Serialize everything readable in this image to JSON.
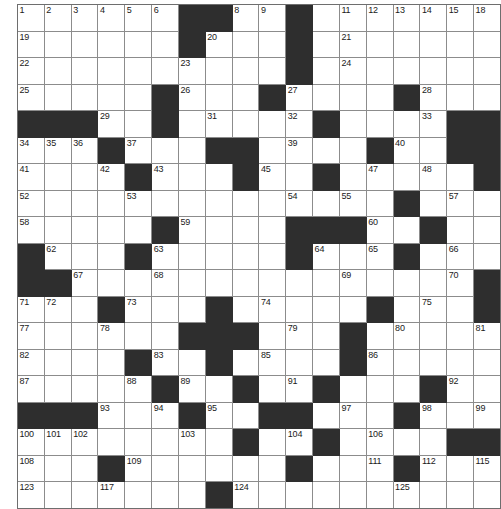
{
  "puzzle": {
    "type": "crossword-grid",
    "columns": 18,
    "rows": 19,
    "cell_size_px": 26,
    "colors": {
      "block": "#2e2e2e",
      "open": "#ffffff",
      "gridline": "#8c8c8c",
      "number_text": "#1a1a1a"
    },
    "total_clue_numbers": 125,
    "column_headers": [
      "1",
      "2",
      "3",
      "4",
      "5",
      "6",
      "7",
      "8",
      "9",
      "10",
      "11",
      "12",
      "13",
      "14",
      "15",
      "16",
      "17",
      "18"
    ],
    "blocks": [
      [
        0,
        6
      ],
      [
        0,
        7
      ],
      [
        0,
        10
      ],
      [
        1,
        6
      ],
      [
        1,
        10
      ],
      [
        2,
        10
      ],
      [
        3,
        5
      ],
      [
        3,
        9
      ],
      [
        3,
        14
      ],
      [
        4,
        0
      ],
      [
        4,
        1
      ],
      [
        4,
        2
      ],
      [
        4,
        5
      ],
      [
        4,
        11
      ],
      [
        4,
        16
      ],
      [
        4,
        17
      ],
      [
        5,
        3
      ],
      [
        5,
        7
      ],
      [
        5,
        8
      ],
      [
        5,
        13
      ],
      [
        5,
        16
      ],
      [
        5,
        17
      ],
      [
        6,
        4
      ],
      [
        6,
        8
      ],
      [
        6,
        11
      ],
      [
        6,
        17
      ],
      [
        7,
        14
      ],
      [
        8,
        5
      ],
      [
        8,
        10
      ],
      [
        8,
        11
      ],
      [
        8,
        12
      ],
      [
        8,
        15
      ],
      [
        9,
        0
      ],
      [
        9,
        4
      ],
      [
        9,
        10
      ],
      [
        9,
        14
      ],
      [
        10,
        0
      ],
      [
        10,
        1
      ],
      [
        10,
        17
      ],
      [
        11,
        3
      ],
      [
        11,
        7
      ],
      [
        11,
        13
      ],
      [
        11,
        17
      ],
      [
        12,
        6
      ],
      [
        12,
        7
      ],
      [
        12,
        8
      ],
      [
        12,
        12
      ],
      [
        13,
        4
      ],
      [
        13,
        7
      ],
      [
        13,
        12
      ],
      [
        14,
        5
      ],
      [
        14,
        8
      ],
      [
        14,
        11
      ],
      [
        14,
        15
      ],
      [
        15,
        0
      ],
      [
        15,
        1
      ],
      [
        15,
        2
      ],
      [
        15,
        6
      ],
      [
        15,
        9
      ],
      [
        15,
        10
      ],
      [
        15,
        14
      ],
      [
        16,
        8
      ],
      [
        16,
        11
      ],
      [
        16,
        16
      ],
      [
        16,
        17
      ],
      [
        17,
        3
      ],
      [
        17,
        10
      ],
      [
        17,
        14
      ],
      [
        18,
        7
      ],
      [
        19,
        7
      ]
    ],
    "numbered_cells": [
      {
        "n": 1,
        "row": 0,
        "col": 0
      },
      {
        "n": 2,
        "row": 0,
        "col": 1
      },
      {
        "n": 3,
        "row": 0,
        "col": 2
      },
      {
        "n": 4,
        "row": 0,
        "col": 3
      },
      {
        "n": 5,
        "row": 0,
        "col": 4
      },
      {
        "n": 6,
        "row": 0,
        "col": 5
      },
      {
        "n": 7,
        "row": 0,
        "col": 7
      },
      {
        "n": 8,
        "row": 0,
        "col": 8
      },
      {
        "n": 9,
        "row": 0,
        "col": 9
      },
      {
        "n": 10,
        "row": 0,
        "col": 10
      },
      {
        "n": 11,
        "row": 0,
        "col": 12
      },
      {
        "n": 12,
        "row": 0,
        "col": 13
      },
      {
        "n": 13,
        "row": 0,
        "col": 14
      },
      {
        "n": 14,
        "row": 0,
        "col": 15
      },
      {
        "n": 15,
        "row": 0,
        "col": 16
      },
      {
        "n": 16,
        "row": 0,
        "col": 17
      },
      {
        "n": 17,
        "row": 0,
        "col": 18
      },
      {
        "n": 18,
        "row": 0,
        "col": 19
      },
      {
        "n": 19,
        "row": 1,
        "col": 0
      },
      {
        "n": 20,
        "row": 1,
        "col": 7
      },
      {
        "n": 21,
        "row": 1,
        "col": 12
      },
      {
        "n": 22,
        "row": 2,
        "col": 0
      },
      {
        "n": 23,
        "row": 2,
        "col": 6
      },
      {
        "n": 24,
        "row": 2,
        "col": 12
      },
      {
        "n": 25,
        "row": 3,
        "col": 0
      },
      {
        "n": 26,
        "row": 3,
        "col": 6
      },
      {
        "n": 27,
        "row": 3,
        "col": 10
      },
      {
        "n": 28,
        "row": 3,
        "col": 15
      },
      {
        "n": 29,
        "row": 4,
        "col": 3
      },
      {
        "n": 30,
        "row": 4,
        "col": 5
      },
      {
        "n": 31,
        "row": 4,
        "col": 7
      },
      {
        "n": 32,
        "row": 4,
        "col": 10
      },
      {
        "n": 33,
        "row": 4,
        "col": 15
      },
      {
        "n": 34,
        "row": 5,
        "col": 0
      },
      {
        "n": 35,
        "row": 5,
        "col": 1
      },
      {
        "n": 36,
        "row": 5,
        "col": 2
      },
      {
        "n": 37,
        "row": 5,
        "col": 4
      },
      {
        "n": 38,
        "row": 5,
        "col": 7
      },
      {
        "n": 39,
        "row": 5,
        "col": 10
      },
      {
        "n": 40,
        "row": 5,
        "col": 14
      },
      {
        "n": 41,
        "row": 6,
        "col": 0
      },
      {
        "n": 42,
        "row": 6,
        "col": 3
      },
      {
        "n": 43,
        "row": 6,
        "col": 5
      },
      {
        "n": 44,
        "row": 6,
        "col": 8
      },
      {
        "n": 45,
        "row": 6,
        "col": 9
      },
      {
        "n": 46,
        "row": 6,
        "col": 11
      },
      {
        "n": 47,
        "row": 6,
        "col": 13
      },
      {
        "n": 48,
        "row": 6,
        "col": 15
      },
      {
        "n": 49,
        "row": 6,
        "col": 17
      },
      {
        "n": 50,
        "row": 6,
        "col": 18
      },
      {
        "n": 51,
        "row": 6,
        "col": 19
      },
      {
        "n": 52,
        "row": 7,
        "col": 0
      },
      {
        "n": 53,
        "row": 7,
        "col": 4
      },
      {
        "n": 54,
        "row": 7,
        "col": 10
      },
      {
        "n": 55,
        "row": 7,
        "col": 12
      },
      {
        "n": 56,
        "row": 7,
        "col": 14
      },
      {
        "n": 57,
        "row": 7,
        "col": 16
      },
      {
        "n": 58,
        "row": 8,
        "col": 0
      },
      {
        "n": 59,
        "row": 8,
        "col": 6
      },
      {
        "n": 60,
        "row": 8,
        "col": 13
      },
      {
        "n": 61,
        "row": 8,
        "col": 15
      },
      {
        "n": 62,
        "row": 9,
        "col": 1
      },
      {
        "n": 63,
        "row": 9,
        "col": 5
      },
      {
        "n": 64,
        "row": 9,
        "col": 11
      },
      {
        "n": 65,
        "row": 9,
        "col": 13
      },
      {
        "n": 66,
        "row": 9,
        "col": 16
      },
      {
        "n": 67,
        "row": 10,
        "col": 2
      },
      {
        "n": 68,
        "row": 10,
        "col": 5
      },
      {
        "n": 69,
        "row": 10,
        "col": 12
      },
      {
        "n": 70,
        "row": 10,
        "col": 16
      },
      {
        "n": 71,
        "row": 11,
        "col": 0
      },
      {
        "n": 72,
        "row": 11,
        "col": 1
      },
      {
        "n": 73,
        "row": 11,
        "col": 4
      },
      {
        "n": 74,
        "row": 11,
        "col": 9
      },
      {
        "n": 75,
        "row": 11,
        "col": 15
      },
      {
        "n": 76,
        "row": 11,
        "col": 18
      },
      {
        "n": 77,
        "row": 12,
        "col": 0
      },
      {
        "n": 78,
        "row": 12,
        "col": 3
      },
      {
        "n": 79,
        "row": 12,
        "col": 10
      },
      {
        "n": 80,
        "row": 12,
        "col": 14
      },
      {
        "n": 81,
        "row": 12,
        "col": 19
      },
      {
        "n": 82,
        "row": 13,
        "col": 0
      },
      {
        "n": 83,
        "row": 13,
        "col": 5
      },
      {
        "n": 84,
        "row": 13,
        "col": 7
      },
      {
        "n": 85,
        "row": 13,
        "col": 9
      },
      {
        "n": 86,
        "row": 13,
        "col": 13
      },
      {
        "n": 87,
        "row": 14,
        "col": 0
      },
      {
        "n": 88,
        "row": 14,
        "col": 4
      },
      {
        "n": 89,
        "row": 14,
        "col": 6
      },
      {
        "n": 90,
        "row": 14,
        "col": 8
      },
      {
        "n": 91,
        "row": 14,
        "col": 10
      },
      {
        "n": 92,
        "row": 14,
        "col": 16
      },
      {
        "n": 93,
        "row": 15,
        "col": 3
      },
      {
        "n": 94,
        "row": 15,
        "col": 5
      },
      {
        "n": 95,
        "row": 15,
        "col": 7
      },
      {
        "n": 96,
        "row": 15,
        "col": 9
      },
      {
        "n": 97,
        "row": 15,
        "col": 12
      },
      {
        "n": 98,
        "row": 15,
        "col": 15
      },
      {
        "n": 99,
        "row": 15,
        "col": 17
      },
      {
        "n": 100,
        "row": 16,
        "col": 0
      },
      {
        "n": 101,
        "row": 16,
        "col": 1
      },
      {
        "n": 102,
        "row": 16,
        "col": 2
      },
      {
        "n": 103,
        "row": 16,
        "col": 6
      },
      {
        "n": 104,
        "row": 16,
        "col": 10
      },
      {
        "n": 105,
        "row": 16,
        "col": 11
      },
      {
        "n": 106,
        "row": 16,
        "col": 13
      },
      {
        "n": 107,
        "row": 16,
        "col": 16
      },
      {
        "n": 108,
        "row": 17,
        "col": 0
      },
      {
        "n": 109,
        "row": 17,
        "col": 4
      },
      {
        "n": 110,
        "row": 17,
        "col": 10
      },
      {
        "n": 111,
        "row": 17,
        "col": 13
      },
      {
        "n": 112,
        "row": 17,
        "col": 15
      },
      {
        "n": 113,
        "row": 17,
        "col": 17
      },
      {
        "n": 114,
        "row": 17,
        "col": 18
      },
      {
        "n": 115,
        "row": 17,
        "col": 19
      },
      {
        "n": 116,
        "row": 18,
        "col": 0
      },
      {
        "n": 117,
        "row": 18,
        "col": 3
      },
      {
        "n": 118,
        "row": 18,
        "col": 8
      },
      {
        "n": 119,
        "row": 18,
        "col": 14
      },
      {
        "n": 120,
        "row": 19,
        "col": 0
      },
      {
        "n": 121,
        "row": 19,
        "col": 8
      },
      {
        "n": 122,
        "row": 19,
        "col": 14
      },
      {
        "n": 123,
        "row": 20,
        "col": 0
      },
      {
        "n": 124,
        "row": 20,
        "col": 8
      },
      {
        "n": 125,
        "row": 20,
        "col": 14
      }
    ]
  }
}
